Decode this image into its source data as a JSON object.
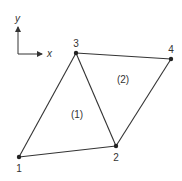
{
  "diagram": {
    "type": "finite-element-mesh",
    "stroke_color": "#333333",
    "background": "#ffffff",
    "axes": {
      "origin": [
        18,
        54
      ],
      "x_tip": [
        42,
        54
      ],
      "y_tip": [
        18,
        27
      ],
      "x_label": "x",
      "y_label": "y"
    },
    "nodes": [
      {
        "id": "1",
        "label": "1",
        "x": 19,
        "y": 157
      },
      {
        "id": "2",
        "label": "2",
        "x": 116,
        "y": 146
      },
      {
        "id": "3",
        "label": "3",
        "x": 76,
        "y": 53
      },
      {
        "id": "4",
        "label": "4",
        "x": 171,
        "y": 59
      }
    ],
    "elements": [
      {
        "id": "1",
        "label": "(1)",
        "nodes": [
          "1",
          "2",
          "3"
        ],
        "label_pos": [
          77,
          118
        ]
      },
      {
        "id": "2",
        "label": "(2)",
        "nodes": [
          "2",
          "4",
          "3"
        ],
        "label_pos": [
          123,
          83
        ]
      }
    ]
  }
}
